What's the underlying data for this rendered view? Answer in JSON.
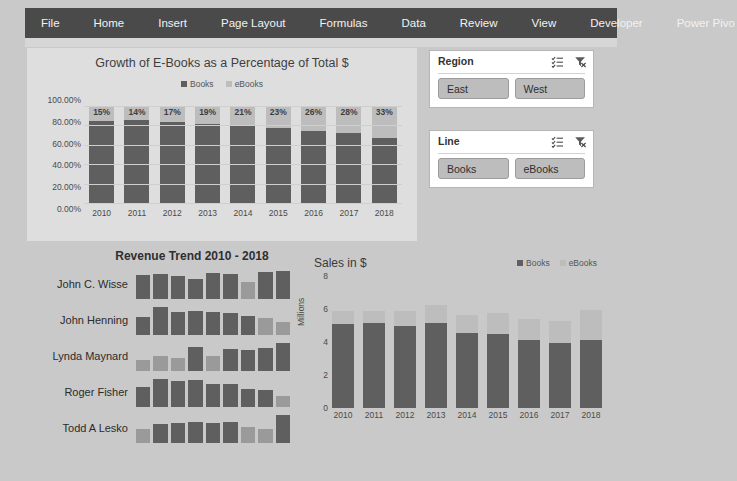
{
  "ribbon": {
    "tabs": [
      {
        "label": "File"
      },
      {
        "label": "Home"
      },
      {
        "label": "Insert"
      },
      {
        "label": "Page Layout"
      },
      {
        "label": "Formulas"
      },
      {
        "label": "Data"
      },
      {
        "label": "Review"
      },
      {
        "label": "View"
      },
      {
        "label": "Developer"
      },
      {
        "label": "Power Pivo"
      }
    ]
  },
  "colors": {
    "books": "#5f5f5f",
    "ebooks": "#bdbdbd",
    "ribbon": "#4a4a4a",
    "panel": "#dedede",
    "worksheet": "#c9c9c9"
  },
  "slicers": [
    {
      "title": "Region",
      "multiselect_icon": "multi-select-icon",
      "clear_icon": "clear-filter-icon",
      "buttons": [
        "East",
        "West"
      ]
    },
    {
      "title": "Line",
      "multiselect_icon": "multi-select-icon",
      "clear_icon": "clear-filter-icon",
      "buttons": [
        "Books",
        "eBooks"
      ]
    }
  ],
  "sparkline_panel": {
    "title": "Revenue Trend 2010 - 2018",
    "rows": [
      {
        "name": "John C. Wisse",
        "values": [
          62,
          64,
          60,
          52,
          66,
          64,
          44,
          70,
          72
        ]
      },
      {
        "name": "John Henning",
        "values": [
          46,
          72,
          58,
          62,
          60,
          56,
          48,
          44,
          34
        ]
      },
      {
        "name": "Lynda Maynard",
        "values": [
          34,
          44,
          40,
          72,
          44,
          66,
          62,
          70,
          84
        ]
      },
      {
        "name": "Roger Fisher",
        "values": [
          52,
          74,
          70,
          72,
          62,
          60,
          48,
          46,
          30
        ]
      },
      {
        "name": "Todd A Lesko",
        "values": [
          40,
          52,
          56,
          58,
          56,
          58,
          44,
          38,
          78
        ]
      }
    ]
  },
  "chart_data": [
    {
      "type": "bar",
      "id": "growth-percent-chart",
      "title": "Growth of E-Books as a Percentage of Total $",
      "stacked": "100%",
      "categories": [
        "2010",
        "2011",
        "2012",
        "2013",
        "2014",
        "2015",
        "2016",
        "2017",
        "2018"
      ],
      "series": [
        {
          "name": "Books",
          "values": [
            85,
            86,
            83,
            81,
            79,
            77,
            74,
            72,
            67
          ]
        },
        {
          "name": "eBooks",
          "values": [
            15,
            14,
            17,
            19,
            21,
            23,
            26,
            28,
            33
          ]
        }
      ],
      "data_labels": [
        "15%",
        "14%",
        "17%",
        "19%",
        "21%",
        "23%",
        "26%",
        "28%",
        "33%"
      ],
      "legend": [
        "Books",
        "eBooks"
      ],
      "legend_position": "top",
      "ylabel": "",
      "xlabel": "",
      "ylim": [
        0,
        100
      ],
      "yticks": [
        "0.00%",
        "20.00%",
        "40.00%",
        "60.00%",
        "80.00%",
        "100.00%"
      ],
      "grid": true
    },
    {
      "type": "bar",
      "id": "sales-chart",
      "title": "Sales in $",
      "stacked": "value",
      "categories": [
        "2010",
        "2011",
        "2012",
        "2013",
        "2014",
        "2015",
        "2016",
        "2017",
        "2018"
      ],
      "series": [
        {
          "name": "Books",
          "values": [
            5.1,
            5.15,
            4.95,
            5.15,
            4.55,
            4.5,
            4.1,
            3.95,
            4.1
          ]
        },
        {
          "name": "eBooks",
          "values": [
            0.8,
            0.75,
            0.9,
            1.1,
            1.1,
            1.25,
            1.3,
            1.35,
            1.85
          ]
        }
      ],
      "legend": [
        "Books",
        "eBooks"
      ],
      "legend_position": "top-right",
      "ylabel": "Millions",
      "xlabel": "",
      "ylim": [
        0,
        8
      ],
      "yticks": [
        "0",
        "2",
        "4",
        "6",
        "8"
      ],
      "grid": false
    }
  ]
}
